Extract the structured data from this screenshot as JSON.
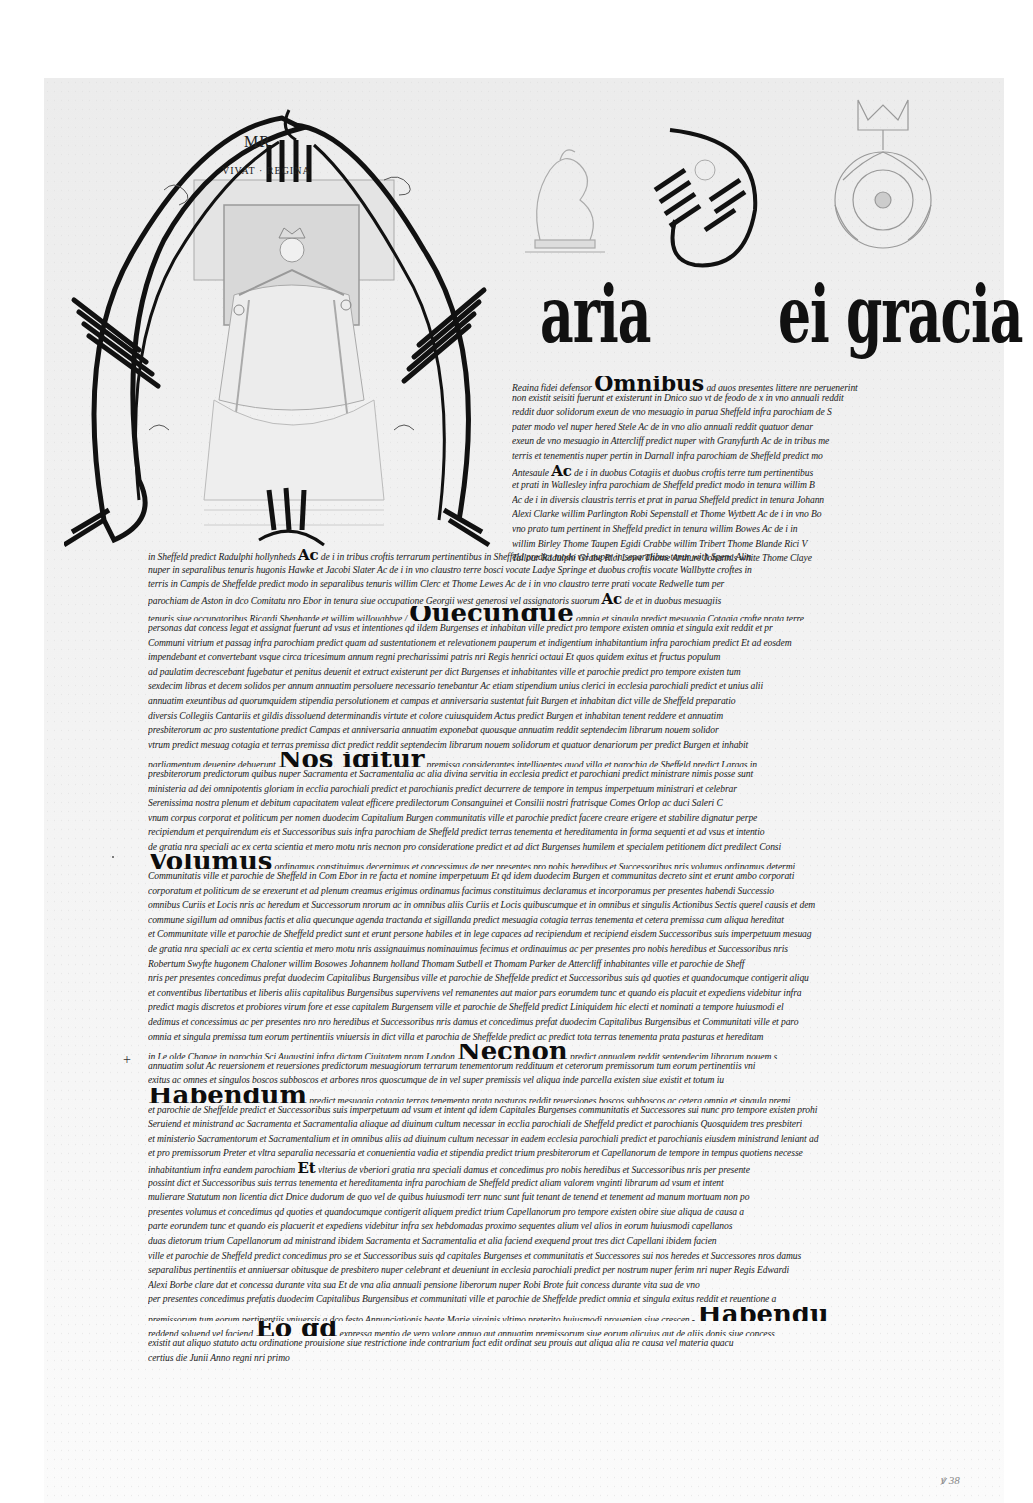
{
  "document": {
    "type": "Royal charter (Queen Mary), Sheffield",
    "background_color": "#f0f0f0",
    "ink_color": "#111111"
  },
  "illumination": {
    "initial_letter": "M",
    "monogram": "MR",
    "motto": "VIVAT · REGINA",
    "rubric_top": "M",
    "rubric_bottom": "W",
    "decoration": [
      "portrait-of-queen-enthroned",
      "lion-crest",
      "crowned-tudor-rose",
      "illuminated-D"
    ]
  },
  "title_line": {
    "word1": "aria",
    "initial_D": "D",
    "word2": "ei gracia"
  },
  "upper_lines": [
    {
      "pre": "Regina fidei defensor ",
      "kw": "Omnibus",
      "post": " ad quos presentes littere nre peruenerint"
    },
    {
      "pre": "non existit seisiti fuerunt et existerunt in Dnico suo vt de feodo de x in vno annuali reddit"
    },
    {
      "pre": "reddit duor solidorum exeun de vno mesuagio in parua Sheffeld infra parochiam de S"
    },
    {
      "pre": "pater modo vel nuper hered        Stele Ac de in vno alio annuali reddit quatuor denar"
    },
    {
      "pre": "exeun de vno mesuagio in Attercliff predict nuper with Granyfurth Ac de in tribus me"
    },
    {
      "pre": "terris et tenementis nuper pertin in Darnall infra parochiam de Sheffeld predict mo"
    },
    {
      "pre": "Antesaule ",
      "kw": "Ac",
      "post": " de i in duobus Cotagiis et duobus croftis terre tum pertinentibus"
    },
    {
      "pre": "et prati in Wallesley infra parochiam de Sheffeld predict modo in tenura willim B"
    },
    {
      "pre": "Ac de i in diversis claustris terris et prat in parua Sheffeld predict in tenura Johann"
    },
    {
      "pre": "Alexi Clarke willim Parlington Robi Sepenstall et Thome Wytbett Ac de i in vno Bo"
    },
    {
      "pre": "vno prato tum pertinent in Sheffeld predict in tenura willim Bowes Ac de i in"
    },
    {
      "pre": "willim Birley Thome Taupen Egidi Crabbe willim Tribert Thome Blande Rici V"
    },
    {
      "pre": "Tailour Radulphi Grabe Rici Lowe Thome Arthure Johannis white Thome Claye"
    }
  ],
  "lower_lines": [
    {
      "pre": "in Sheffeld predict Radulphi hollynheds ",
      "kw": "Ac",
      "post": " de i in tribus croftis terrarum pertinentibus in Sheffeld predict modo vel nuper in separalibus tenur with Spenc Alin"
    },
    {
      "pre": "nuper in separalibus tenuris hugonis Hawke et Jacobi Slater Ac de i in vno claustro terre bosci vocate Ladye Springe et duobus croftis vocate Wallbytte croftes in"
    },
    {
      "pre": "terris in Campis de Sheffelde predict modo in separalibus tenuris willim Clerc et Thome Lewes Ac de i in vno claustro terre prati vocate Redwelle tum per"
    },
    {
      "pre": "parochiam de Aston in dco Comitatu nro Ebor in tenura siue occupatione Georgii west generosi vel assignatoris suorum ",
      "kw": "Ac",
      "post": " de et in duobus mesuagiis"
    },
    {
      "pre": "tenuris siue occupatoribus Ricardi Shepharde et willim willoughbye / ",
      "kw": "Quecunque",
      "post": " omnia et singula predict mesuagia Cotagia crofte prata terre"
    },
    {
      "pre": "personas dat concess legat et assignat fuerunt ad vsus et intentiones qd ildem Burgenses et inhabitan ville predict pro tempore existen omnia et singula exit reddit et pr"
    },
    {
      "pre": "Communi vitrium et passag infra parochiam predict quam ad sustentationem et relevationem pauperum et indigentium inhabitantium infra parochiam predict Et ad eosdem"
    },
    {
      "pre": "impendebant et convertebant vsque circa tricesimum annum regni precharissimi patris nri Regis henrici octaui Et quos quidem exitus et fructus populum"
    },
    {
      "pre": "ad paulatim decrescebant fugebatur et penitus deuenit et extruct existerunt per dict Burgenses et inhabitantes ville et parochie predict pro tempore existen tum"
    },
    {
      "pre": "sexdecim libras et decem solidos per annum annuatim persoluere necessario tenebantur Ac etiam stipendium unius clerici in ecclesia parochiali predict et unius alii"
    },
    {
      "pre": "annuatim exeuntibus ad quorumquidem stipendia persolutionem et campas et anniversaria sustentat fuit Burgen et inhabitan dict ville de Sheffeld preparatio"
    },
    {
      "pre": "diversis Collegiis Cantariis et gildis dissoluend determinandis virtute et colore cuiusquidem Actus predict Burgen et inhabitan tenent reddere et annuatim"
    },
    {
      "pre": "presbiterorum ac pro sustentatione predict Campas et anniversaria annuatim exponebat quousque annuatim reddit septendecim librarum nouem solidor"
    },
    {
      "pre": "vtrum predict mesuag cotagia et terras premissa dict predict reddit septendecim librarum nouem solidorum et quatuor denariorum per predict Burgen et inhabit"
    },
    {
      "pre": "parliamentum deuenire debuerunt  ",
      "kw": "Nos igitur",
      "post": " premissa considerantes intelligentes quod villa et parochia de Sheffeld predict Largas in"
    },
    {
      "pre": "presbiterorum predictorum quibus nuper Sacramenta et Sacramentalia ac alia divina servitia in ecclesia predict et parochiani predict ministrare nimis posse sunt"
    },
    {
      "pre": "ministeria ad dei omnipotentis gloriam in ecclia parochiali predict et parochianis predict decurrere de tempore in tempus imperpetuum ministrari et celebrar"
    },
    {
      "pre": "Serenissima nostra plenum et debitum capacitatem valeat efficere predilectorum Consanguinei et Consilii nostri fratrisque Comes Orlop ac duci Saleri C"
    },
    {
      "pre": "vnum corpus corporat et politicum per nomen duodecim Capitalium Burgen communitatis ville et parochie predict facere creare erigere et stabilire dignatur perpe"
    },
    {
      "pre": "recipiendum et perquirendum eis et Successoribus suis infra parochiam de Sheffeld predict terras tenementa et hereditamenta in forma sequenti et ad vsus et intentio"
    },
    {
      "pre": "de gratia nra speciali ac ex certa scientia et mero motu nris necnon pro consideratione predict et ad dict Burgenses humilem et specialem petitionem dict predilect Consi"
    },
    {
      "pre": "",
      "kw": "Volumus",
      "post": " ordinamus constituimus decernimus et concessimus de per presentes pro nobis heredibus et Successoribus nris volumus ordinamus determi"
    },
    {
      "pre": "Communitatis ville et parochie de Sheffeld in Com Ebor in re facta et nomine imperpetuum Et qd idem duodecim Burgen et communitas decreto sint et erunt ambo corporati"
    },
    {
      "pre": "corporatum et politicum de se erexerunt et ad plenum creamus erigimus ordinamus facimus constituimus declaramus et incorporamus per presentes habendi Successio"
    },
    {
      "pre": "omnibus Curiis et Locis nris ac heredum et Successorum nrorum ac in omnibus aliis Curiis et Locis quibuscumque et in omnibus et singulis Actionibus Sectis querel causis et dem"
    },
    {
      "pre": "commune sigillum ad omnibus factis et alia quecunque agenda tractanda et sigillanda predict mesuagia cotagia terras tenementa et cetera premissa cum aliqua hereditat"
    },
    {
      "pre": "et Communitate ville et parochie de Sheffeld predict sunt et erunt persone habiles et in lege capaces ad recipiendum et recipiend eisdem Successoribus suis imperpetuum mesuag"
    },
    {
      "pre": "de gratia nra speciali ac ex certa scientia et mero motu nris assignauimus nominauimus fecimus et ordinauimus ac per presentes pro nobis heredibus et Successoribus nris"
    },
    {
      "pre": "Robertum Swyfte hugonem Chaloner willim Bosowes Johannem holland Thomam Sutbell et Thomam Parker de Attercliff inhabitantes ville et parochie de Sheff"
    },
    {
      "pre": "nris per presentes concedimus prefat duodecim Capitalibus Burgensibus ville et parochie de Sheffelde predict et Successoribus suis qd quoties et quandocumque contigerit aliqu"
    },
    {
      "pre": "et conventibus libertatibus et liberis aliis capitalibus Burgensibus supervivens vel remanentes aut maior pars eorumdem tunc et quando eis placuit et expediens videbitur infra"
    },
    {
      "pre": "predict magis discretos et probiores virum fore et esse capitalem Burgensem ville et parochie de Sheffeld predict Liniquidem hic electi et nominati a tempore huiusmodi el"
    },
    {
      "pre": "dedimus et concessimus ac per presentes nro nro heredibus et Successoribus nris damus et concedimus prefat duodecim Capitalibus Burgensibus et Communitati ville et paro"
    },
    {
      "pre": "omnia et singula premissa tum eorum pertinentiis vniuersis in dict villa et parochia de Sheffelde predict ac predict tota terras tenementa prata pasturas et hereditam"
    },
    {
      "pre": "in Le olde Change in parochia Sci Augustini infra dictam Ciuitatem nram London ",
      "kw": "Necnon",
      "post": " predict annualem reddit septendecim librarum nouem s"
    },
    {
      "pre": "annuatim solut Ac reuersionem et reuersiones predictorum mesuagiorum terrarum tenementorum reddituum et ceterorum premissorum tum eorum pertinentiis vni"
    },
    {
      "pre": "exitus ac omnes et singulos boscos subboscos et arbores nros quoscumque de in vel super premissis vel aliqua inde parcella existen siue existit et totum iu"
    },
    {
      "pre": "",
      "kw": "Habendum",
      "post": " predict mesuagia cotagia terras tenementa prata pasturas reddit reuersiones boscos subboscos ac cetera omnia et singula premi"
    },
    {
      "pre": "et parochie de Sheffelde predict et Successoribus suis imperpetuum ad vsum et intent qd idem Capitales Burgenses communitatis et Successores sui nunc pro tempore existen prohi"
    },
    {
      "pre": "Seruiend et ministrand ac Sacramenta et Sacramentalia aliaque ad diuinum cultum necessar in ecclia parochiali de Sheffeld predict et parochianis Quosquidem tres presbiteri"
    },
    {
      "pre": "et ministerio Sacramentorum et Sacramentalium et in omnibus aliis ad diuinum cultum necessar in eadem ecclesia parochiali predict et parochianis eiusdem ministrand leniant ad"
    },
    {
      "pre": "et pro premissorum  Preter et vltra separalia necessaria et conuenientia vadia et stipendia predict trium presbiterorum et Capellanorum de tempore in tempus quotiens necesse"
    },
    {
      "pre": "inhabitantium infra eandem parochiam ",
      "kw": "Et",
      "post": " vlterius de vberiori gratia nra speciali damus et concedimus pro nobis heredibus et Successoribus nris per presente"
    },
    {
      "pre": "possint dict et Successoribus suis terras tenementa et hereditamenta infra parochiam de Sheffeld predict aliam valorem vnginti librarum ad vsum et intent"
    },
    {
      "pre": "mulierare Statutum non licentia dict Dnice dudorum de quo vel de quibus huiusmodi terr nunc sunt fuit tenant de tenend et tenement ad manum mortuam non po"
    },
    {
      "pre": "presentes volumus et concedimus qd quoties et quandocumque contigerit aliquem predict trium Capellanorum pro tempore existen obire siue aliqua de causa a"
    },
    {
      "pre": "parte eorundem tunc et quando eis placuerit et expediens videbitur infra sex hebdomadas proximo sequentes alium vel alios in eorum huiusmodi capellanos"
    },
    {
      "pre": "duas dietorum trium Capellanorum ad ministrand ibidem Sacramenta et Sacramentalia et alia faciend exequend prout tres dict Capellani ibidem facien"
    },
    {
      "pre": "ville et parochie de Sheffeld predict concedimus pro se et Successoribus suis qd capitales Burgenses et communitatis et Successores sui nos heredes et Successores nros damus"
    },
    {
      "pre": "separalibus pertinentiis et anniuersar obitusque de presbitero nuper celebrant et deueniunt in ecclesia parochiali predict per nostrum nuper ferim nri nuper Regis Edwardi"
    },
    {
      "pre": "Alexi Borbe clare dat et concessa durante vita sua Et de vna alia annuali pensione liberorum nuper Robi Brote fuit concess durante vita sua de vno"
    },
    {
      "pre": "per presentes concedimus prefatis duodecim Capitalibus Burgensibus et communitati ville et parochie de Sheffelde predict omnia et singula exitus reddit et reuentione a"
    },
    {
      "pre": "premissorum tum eorum pertinentiis vniuersis a dco festo Annunciationis beate Marie virginis vltimo preterito huiusmodi prouenien siue crescen  - ",
      "kw": "Habendu",
      "post": ""
    },
    {
      "pre": "reddend soluend vel faciend ",
      "kw": "Eo qd",
      "post": " expressa mentio de vero valore annuo aut annuatim premissorum siue eorum alicuius aut de aliis donis siue concess"
    },
    {
      "pre": "existit aut aliquo statuto actu ordinatione prouisione siue restrictione inde contrarium fact edit ordinat seu prouis aut aliqua alia re causa vel materia quacu"
    },
    {
      "pre": "certius die Junii Anno regni nri primo"
    }
  ],
  "margin_marks": {
    "cross": "+",
    "folio": "ꝟ 38"
  }
}
